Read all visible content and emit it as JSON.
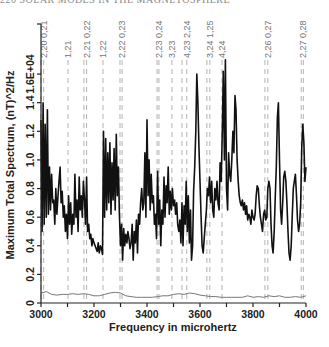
{
  "page": {
    "header": "220   SOLAR MODES IN THE MAGNETOSPHERE"
  },
  "chart_data": {
    "type": "line",
    "title": "",
    "xlabel": "Frequency in microhertz",
    "ylabel": "Maximum Total Spectrum, (nT)^2/Hz",
    "xlim": [
      3000,
      4000
    ],
    "ylim": [
      0,
      1.95
    ],
    "x_ticks": [
      3000,
      3200,
      3400,
      3600,
      3800,
      4000
    ],
    "x_tick_labels": [
      "3000",
      "3200",
      "3400",
      "3600",
      "3800",
      "4000"
    ],
    "y_ticks": [
      0,
      0.2,
      0.4,
      0.6,
      0.8,
      1.0,
      1.2,
      1.4,
      1.6
    ],
    "y_tick_labels": [
      "0",
      "0.2",
      "0.4",
      "0.6",
      "0.8",
      "1.0",
      "1.2",
      "1.4",
      "1.6E+04"
    ],
    "grid": false,
    "legend": null,
    "mode_markers": [
      {
        "label": "2,20 0,21",
        "freqs": [
          3000,
          3010
        ]
      },
      {
        "label": "1,21",
        "freqs": [
          3102
        ]
      },
      {
        "label": "2,21 0,22",
        "freqs": [
          3162,
          3172
        ]
      },
      {
        "label": "1,22",
        "freqs": [
          3234
        ]
      },
      {
        "label": "2,22 0,23",
        "freqs": [
          3298,
          3306
        ]
      },
      {
        "label": "2,23 0,24",
        "freqs": [
          3438,
          3445
        ]
      },
      {
        "label": "3,23",
        "freqs": [
          3494
        ]
      },
      {
        "label": "4,23 2,24",
        "freqs": [
          3532,
          3550
        ]
      },
      {
        "label": "3,24 1,25",
        "freqs": [
          3626,
          3637
        ]
      },
      {
        "label": "4,24",
        "freqs": [
          3683
        ]
      },
      {
        "label": "2,26 0,27",
        "freqs": [
          3845,
          3856
        ]
      },
      {
        "label": "2,27 0,28",
        "freqs": [
          3982,
          3990
        ]
      }
    ],
    "series": [
      {
        "name": "Maximum total spectrum",
        "color": "#111111",
        "x": [
          3000,
          3004,
          3008,
          3012,
          3016,
          3020,
          3024,
          3028,
          3032,
          3036,
          3040,
          3044,
          3048,
          3052,
          3056,
          3060,
          3064,
          3068,
          3072,
          3076,
          3080,
          3084,
          3088,
          3092,
          3096,
          3100,
          3104,
          3108,
          3112,
          3116,
          3120,
          3124,
          3128,
          3132,
          3136,
          3140,
          3144,
          3148,
          3152,
          3156,
          3160,
          3164,
          3168,
          3172,
          3176,
          3180,
          3184,
          3188,
          3192,
          3196,
          3200,
          3204,
          3208,
          3212,
          3216,
          3220,
          3224,
          3228,
          3232,
          3236,
          3240,
          3244,
          3248,
          3252,
          3256,
          3260,
          3264,
          3268,
          3272,
          3276,
          3280,
          3284,
          3288,
          3292,
          3296,
          3300,
          3304,
          3308,
          3312,
          3316,
          3320,
          3324,
          3328,
          3332,
          3336,
          3340,
          3344,
          3348,
          3352,
          3356,
          3360,
          3364,
          3368,
          3372,
          3376,
          3380,
          3384,
          3388,
          3392,
          3396,
          3400,
          3404,
          3408,
          3412,
          3416,
          3420,
          3424,
          3428,
          3432,
          3436,
          3440,
          3444,
          3448,
          3452,
          3456,
          3460,
          3464,
          3468,
          3472,
          3476,
          3480,
          3484,
          3488,
          3492,
          3496,
          3500,
          3504,
          3508,
          3512,
          3516,
          3520,
          3524,
          3528,
          3532,
          3536,
          3540,
          3544,
          3548,
          3552,
          3556,
          3560,
          3564,
          3568,
          3572,
          3576,
          3580,
          3584,
          3588,
          3592,
          3596,
          3600,
          3604,
          3608,
          3612,
          3616,
          3620,
          3624,
          3628,
          3632,
          3636,
          3640,
          3644,
          3648,
          3652,
          3656,
          3660,
          3664,
          3668,
          3672,
          3676,
          3680,
          3684,
          3688,
          3692,
          3696,
          3700,
          3704,
          3708,
          3712,
          3716,
          3720,
          3724,
          3728,
          3732,
          3736,
          3740,
          3744,
          3748,
          3752,
          3756,
          3760,
          3764,
          3768,
          3772,
          3776,
          3780,
          3784,
          3788,
          3792,
          3796,
          3800,
          3804,
          3808,
          3812,
          3816,
          3820,
          3824,
          3828,
          3832,
          3836,
          3840,
          3844,
          3848,
          3852,
          3856,
          3860,
          3864,
          3868,
          3872,
          3876,
          3880,
          3884,
          3888,
          3892,
          3896,
          3900,
          3904,
          3908,
          3912,
          3916,
          3920,
          3924,
          3928,
          3932,
          3936,
          3940,
          3944,
          3948,
          3952,
          3956,
          3960,
          3964,
          3968,
          3972,
          3976,
          3980,
          3984,
          3988,
          3992,
          3996,
          4000
        ],
        "y": [
          1.28,
          0.5,
          1.4,
          0.55,
          1.25,
          0.6,
          1.35,
          0.62,
          0.95,
          0.65,
          0.9,
          0.7,
          0.72,
          0.55,
          0.8,
          0.62,
          0.75,
          0.85,
          0.95,
          0.7,
          0.78,
          0.6,
          0.68,
          0.5,
          0.62,
          0.45,
          0.75,
          0.55,
          0.7,
          0.48,
          0.62,
          0.55,
          0.9,
          0.6,
          0.72,
          0.5,
          0.88,
          0.65,
          0.75,
          0.6,
          0.85,
          0.72,
          0.55,
          0.88,
          0.5,
          0.55,
          0.45,
          0.48,
          0.4,
          0.45,
          0.42,
          0.4,
          0.38,
          0.36,
          0.42,
          0.35,
          0.4,
          0.38,
          0.34,
          1.2,
          0.6,
          1.15,
          0.65,
          1.05,
          0.7,
          1.12,
          0.62,
          0.98,
          0.72,
          1.08,
          0.65,
          1.18,
          0.75,
          0.95,
          0.62,
          0.4,
          0.55,
          0.3,
          0.52,
          0.4,
          0.48,
          0.42,
          0.5,
          0.45,
          0.38,
          0.42,
          0.55,
          0.3,
          0.5,
          0.42,
          0.58,
          0.35,
          0.62,
          0.55,
          0.7,
          0.8,
          0.65,
          0.7,
          1.05,
          0.6,
          1.28,
          0.75,
          1.0,
          0.65,
          0.9,
          0.7,
          0.75,
          0.55,
          0.62,
          0.45,
          0.92,
          0.55,
          0.72,
          0.4,
          0.65,
          0.55,
          0.88,
          0.6,
          0.82,
          0.7,
          0.95,
          0.62,
          0.78,
          0.65,
          0.8,
          0.68,
          0.72,
          0.62,
          0.7,
          0.55,
          0.5,
          0.58,
          0.42,
          0.7,
          0.4,
          0.68,
          0.55,
          0.85,
          0.5,
          0.75,
          0.42,
          0.65,
          0.3,
          0.4,
          0.78,
          0.95,
          1.2,
          1.6,
          1.4,
          1.1,
          0.85,
          0.6,
          0.4,
          0.35,
          0.45,
          0.55,
          0.65,
          0.8,
          0.75,
          0.88,
          0.7,
          0.85,
          0.65,
          0.6,
          0.8,
          0.72,
          0.85,
          0.7,
          0.65,
          0.98,
          0.85,
          1.2,
          1.62,
          1.0,
          1.7,
          0.8,
          0.65,
          1.05,
          0.9,
          0.85,
          1.0,
          1.2,
          1.05,
          1.45,
          1.35,
          1.0,
          0.85,
          0.75,
          0.7,
          0.68,
          0.72,
          0.65,
          0.7,
          0.62,
          0.68,
          0.58,
          0.62,
          0.6,
          0.55,
          0.65,
          0.6,
          0.58,
          0.62,
          0.75,
          0.82,
          0.8,
          0.68,
          0.6,
          0.55,
          0.5,
          0.62,
          0.65,
          0.58,
          0.6,
          0.8,
          0.85,
          0.8,
          0.55,
          0.4,
          0.35,
          0.5,
          0.75,
          0.95,
          1.3,
          1.4,
          1.0,
          0.65,
          0.55,
          0.7,
          0.88,
          0.92,
          0.85,
          0.7,
          0.5,
          0.35,
          0.3,
          0.4,
          0.6,
          0.8,
          0.85,
          0.9,
          0.75,
          0.58,
          0.5,
          0.55,
          0.7,
          1.1,
          1.25,
          1.12,
          0.85,
          0.95
        ]
      },
      {
        "name": "Baseline spectrum",
        "color": "#777777",
        "x": [
          3000,
          3020,
          3040,
          3060,
          3080,
          3100,
          3120,
          3140,
          3160,
          3180,
          3200,
          3220,
          3240,
          3260,
          3280,
          3300,
          3320,
          3340,
          3360,
          3380,
          3400,
          3420,
          3440,
          3460,
          3480,
          3500,
          3520,
          3540,
          3560,
          3580,
          3600,
          3620,
          3640,
          3660,
          3680,
          3700,
          3720,
          3740,
          3760,
          3780,
          3800,
          3820,
          3840,
          3860,
          3880,
          3900,
          3920,
          3940,
          3960,
          3980,
          4000
        ],
        "y": [
          0.07,
          0.08,
          0.06,
          0.055,
          0.06,
          0.06,
          0.065,
          0.06,
          0.065,
          0.06,
          0.05,
          0.05,
          0.06,
          0.07,
          0.075,
          0.07,
          0.05,
          0.045,
          0.04,
          0.04,
          0.04,
          0.04,
          0.045,
          0.05,
          0.05,
          0.06,
          0.065,
          0.06,
          0.07,
          0.065,
          0.055,
          0.05,
          0.045,
          0.045,
          0.04,
          0.04,
          0.04,
          0.04,
          0.04,
          0.05,
          0.04,
          0.045,
          0.04,
          0.05,
          0.045,
          0.05,
          0.04,
          0.04,
          0.045,
          0.04,
          0.05
        ]
      }
    ]
  }
}
